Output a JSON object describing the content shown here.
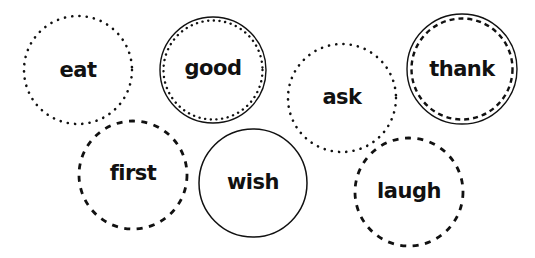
{
  "colors": {
    "stroke": "#111111",
    "background": "#ffffff"
  },
  "circles": [
    {
      "word": "eat",
      "cx": 78,
      "cy": 70,
      "r": 54,
      "style": "dotted"
    },
    {
      "word": "good",
      "cx": 213,
      "cy": 70,
      "r": 53,
      "style": "solid-with-dotted-inner"
    },
    {
      "word": "ask",
      "cx": 342,
      "cy": 98,
      "r": 54,
      "style": "dotted"
    },
    {
      "word": "thank",
      "cx": 462,
      "cy": 69,
      "r": 55,
      "style": "solid-with-dashed-inner"
    },
    {
      "word": "first",
      "cx": 133,
      "cy": 175,
      "r": 54,
      "style": "dashed"
    },
    {
      "word": "wish",
      "cx": 253,
      "cy": 183,
      "r": 54,
      "style": "solid"
    },
    {
      "word": "laugh",
      "cx": 409,
      "cy": 192,
      "r": 54,
      "style": "dashed"
    }
  ]
}
